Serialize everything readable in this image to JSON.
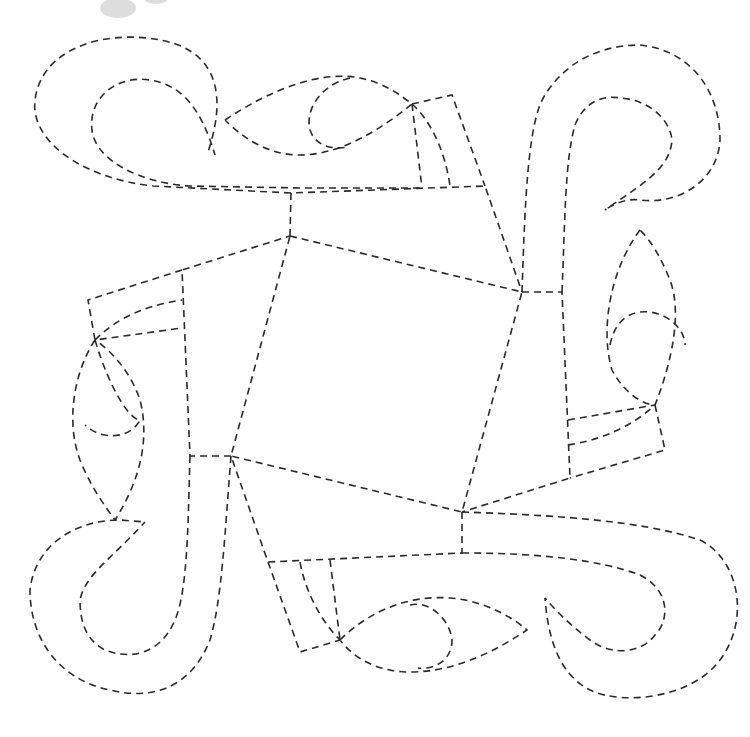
{
  "figure": {
    "kind": "quilting-pattern",
    "width": 750,
    "height": 737,
    "line_color": "#2a2a2a",
    "background": "#ffffff",
    "paths": [
      {
        "name": "center-square",
        "d": "M290 236 L522 292 L462 512 L231 456 Z"
      },
      {
        "name": "top-band-outer",
        "d": "M290 236 L291 193 L485 186 L522 292"
      },
      {
        "name": "top-band-inner",
        "d": "M291 193 L153 186 C 80 178 30 140 35 100 C 42 45 110 30 160 40 C 205 48 232 80 208 152"
      },
      {
        "name": "top-scroll-inner",
        "d": "M420 188 L300 188 L190 186 C 140 183 95 160 92 130 C 88 95 120 75 150 80 C 180 85 200 105 215 155"
      },
      {
        "name": "top-leaf",
        "d": "M225 120 C 270 90 320 70 360 78 C 385 83 400 95 412 104 C 380 130 340 155 300 155 C 270 155 245 140 225 120"
      },
      {
        "name": "top-leaf-loop",
        "d": "M350 78 C 320 85 305 110 310 130 C 315 145 330 150 348 147"
      },
      {
        "name": "top-tab",
        "d": "M412 104 L452 95 L485 186"
      },
      {
        "name": "top-tab-lines",
        "d": "M412 104 L422 188 M412 104 C 430 120 445 150 450 186"
      },
      {
        "name": "right-band-outer",
        "d": "M522 292 L562 292 L570 478 L462 512"
      },
      {
        "name": "right-band",
        "d": "M522 292 C 525 200 528 120 545 95 C 570 55 610 45 640 45 C 690 50 720 90 720 140 C 718 180 680 205 640 200 C 625 198 612 205 605 210"
      },
      {
        "name": "right-band-inner",
        "d": "M562 292 C 565 220 565 160 575 125 C 585 100 605 95 620 98 C 650 100 670 120 672 140 C 670 170 640 185 605 210"
      },
      {
        "name": "right-leaf",
        "d": "M640 230 C 610 270 600 330 612 370 C 625 395 645 405 655 405 C 665 380 685 320 670 280 C 660 255 650 240 640 230"
      },
      {
        "name": "right-leaf-loop",
        "d": "M610 345 C 615 320 630 310 650 312 C 670 315 685 330 685 345"
      },
      {
        "name": "right-tab",
        "d": "M655 405 L665 450 L570 478 M568 420 L655 405 M568 445 C 600 440 630 428 655 405"
      },
      {
        "name": "bottom-band-outer",
        "d": "M462 512 L462 553 L268 562 L231 456"
      },
      {
        "name": "bottom-band",
        "d": "M462 512 C 550 515 640 520 700 540 C 740 560 750 620 720 660 C 690 700 620 705 590 690 C 560 675 548 640 545 598"
      },
      {
        "name": "bottom-band-inner",
        "d": "M462 553 C 540 553 600 560 640 575 C 670 590 670 620 655 635 C 640 655 610 655 590 640 C 570 625 555 610 545 598"
      },
      {
        "name": "bottom-leaf",
        "d": "M340 640 C 370 610 410 595 450 598 C 480 600 510 615 527 630 C 490 655 450 672 410 672 C 380 672 355 660 340 640"
      },
      {
        "name": "bottom-leaf-loop",
        "d": "M410 605 C 430 600 450 620 452 640 C 452 660 435 670 418 668"
      },
      {
        "name": "bottom-tab",
        "d": "M268 562 L300 652 L340 640 M300 562 C 305 590 320 620 340 640 M330 560 L340 640"
      },
      {
        "name": "left-band-outer",
        "d": "M231 456 L190 456 L182 270 L290 236"
      },
      {
        "name": "left-band",
        "d": "M231 456 C 225 530 222 600 210 640 C 190 690 150 700 110 690 C 60 680 30 640 30 590 C 35 545 75 520 120 520 L 145 522"
      },
      {
        "name": "left-band-inner",
        "d": "M190 456 C 188 520 188 590 175 620 C 160 655 130 660 105 650 C 85 640 80 620 80 600 C 85 575 110 560 145 522"
      },
      {
        "name": "left-leaf",
        "d": "M95 340 C 75 370 65 420 80 460 C 92 490 108 510 115 520 C 140 480 150 440 140 400 C 130 370 110 350 95 340"
      },
      {
        "name": "left-leaf-loop",
        "d": "M95 340 C 110 390 130 420 140 420 C 130 440 100 440 85 425"
      },
      {
        "name": "left-tab",
        "d": "M182 270 L88 300 L95 340 L182 328 M95 340 C 120 315 150 305 182 300"
      }
    ],
    "smudge": {
      "name": "gray-smudge",
      "cx": 118,
      "cy": 8,
      "rx": 18,
      "ry": 10
    }
  }
}
